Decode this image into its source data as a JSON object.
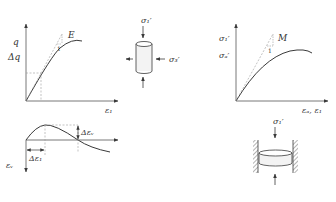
{
  "colors": {
    "line": "#3a3a3a",
    "axis": "#555555",
    "dashed": "#9a9a9a",
    "text": "#333333",
    "hatch": "#444444",
    "fill": "#f3f3f3"
  },
  "triaxial_curve": {
    "y_label_top": "q",
    "y_label_bottom": "Δq",
    "x_label": "ε₁",
    "slope_label": "E",
    "slope_unit": "1"
  },
  "volumetric_curve": {
    "y_label": "εᵥ",
    "dx_label": "Δε₁",
    "dy_label": "Δεᵥ"
  },
  "triaxial_sample": {
    "axial_stress": "σ₁′",
    "radial_stress": "σ₃′"
  },
  "oedometer_curve": {
    "y_label_top": "σ₁′",
    "y_label_bottom": "σₐ′",
    "x_label": "εₐ, ε₁",
    "slope_label": "M",
    "slope_unit": "1"
  },
  "oedometer_sample": {
    "axial_stress": "σ₁′"
  }
}
